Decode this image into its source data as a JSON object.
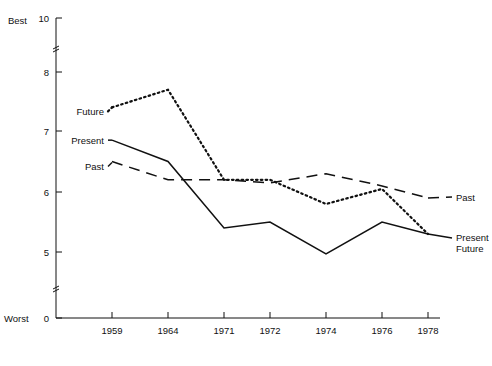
{
  "chart_data": {
    "type": "line",
    "title": "",
    "xlabel": "",
    "ylabel": "",
    "categories": [
      "1959",
      "1964",
      "1971",
      "1972",
      "1974",
      "1976",
      "1978"
    ],
    "x": [
      1959,
      1964,
      1971,
      1972,
      1974,
      1976,
      1978
    ],
    "ylim": [
      0,
      10
    ],
    "yticks": [
      "0",
      "5",
      "6",
      "7",
      "8",
      "10"
    ],
    "ytick_values": [
      0,
      5,
      6,
      7,
      8,
      10
    ],
    "y_axis_top_label": "Best",
    "y_axis_bottom_label": "Worst",
    "grid": false,
    "legend_position": "inline-endpoints",
    "axis_breaks": [
      {
        "between": [
          8,
          10
        ],
        "note": "scale break mark on y-axis"
      },
      {
        "between": [
          0,
          5
        ],
        "note": "scale break mark on y-axis"
      }
    ],
    "series": [
      {
        "name": "Past",
        "style": "dashed",
        "color": "#111111",
        "values": [
          6.5,
          6.2,
          6.2,
          6.15,
          6.3,
          6.1,
          5.9
        ],
        "label_left": "Past",
        "label_right": "Past"
      },
      {
        "name": "Present",
        "style": "solid",
        "color": "#111111",
        "values": [
          6.85,
          6.5,
          5.4,
          5.5,
          4.85,
          5.5,
          5.3
        ],
        "label_left": "Present",
        "label_right": "Present"
      },
      {
        "name": "Future",
        "style": "dotted",
        "color": "#111111",
        "values": [
          7.4,
          7.7,
          6.2,
          6.2,
          5.8,
          6.05,
          5.3
        ],
        "label_left": "Future",
        "label_right": "Future"
      }
    ]
  },
  "labels": {
    "best": "Best",
    "worst": "Worst",
    "left_future": "Future",
    "left_present": "Present",
    "left_past": "Past",
    "right_past": "Past",
    "right_present": "Present",
    "right_future": "Future"
  },
  "caption": {
    "text": ""
  }
}
